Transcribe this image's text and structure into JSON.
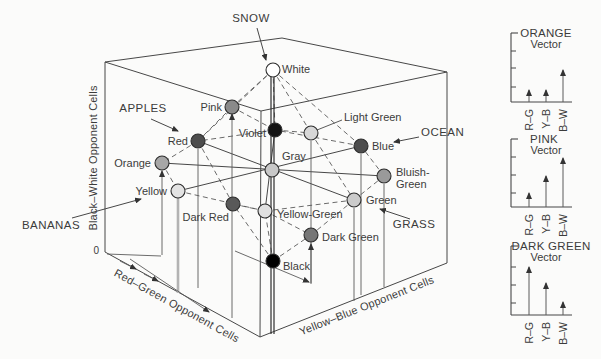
{
  "colors": {
    "ink": "#474747",
    "dash": "#5a5a5a",
    "text": "#3b3b3b",
    "bg": "#fbfbfa",
    "node_stroke": "#2d2d2d",
    "thick_drop": "#b3b3b3",
    "arrow": "#333333"
  },
  "cube": {
    "axis_labels": {
      "vertical": "Black–White Opponent Cells",
      "left": "Red–Green Opponent Cells",
      "right": "Yellow–Blue Opponent Cells",
      "origin": "0"
    },
    "corners": {
      "A": [
        105,
        62
      ],
      "B": [
        282,
        38
      ],
      "C": [
        447,
        72
      ],
      "D": [
        261,
        111
      ],
      "A2": [
        105,
        252
      ],
      "D2": [
        260,
        337
      ],
      "C2": [
        447,
        263
      ]
    },
    "edges": [
      [
        "A",
        "B"
      ],
      [
        "B",
        "C"
      ],
      [
        "A",
        "D"
      ],
      [
        "D",
        "C"
      ],
      [
        "A",
        "A2"
      ],
      [
        "D",
        "D2"
      ],
      [
        "C",
        "C2"
      ],
      [
        "A2",
        "D2"
      ],
      [
        "D2",
        "C2"
      ]
    ],
    "axis_line": {
      "x1": 271,
      "x2": 274,
      "y1": 77,
      "y2": 334
    },
    "nodes": [
      {
        "id": "white",
        "label": "White",
        "x": 273,
        "y": 70,
        "fill": "#ffffff",
        "lx": 282,
        "ly": 73,
        "anchor": "start"
      },
      {
        "id": "pink",
        "label": "Pink",
        "x": 232,
        "y": 107,
        "fill": "#8a8a8a",
        "lx": 222,
        "ly": 111,
        "anchor": "end"
      },
      {
        "id": "violet",
        "label": "Violet",
        "x": 275,
        "y": 130,
        "fill": "#141414",
        "lx": 266,
        "ly": 137,
        "anchor": "end"
      },
      {
        "id": "light_green",
        "label": "Light Green",
        "x": 311,
        "y": 133,
        "fill": "#d7d7d7",
        "lx": 344,
        "ly": 121,
        "anchor": "start"
      },
      {
        "id": "red",
        "label": "Red",
        "x": 198,
        "y": 141,
        "fill": "#4d4d4d",
        "lx": 188,
        "ly": 145,
        "anchor": "end"
      },
      {
        "id": "blue",
        "label": "Blue",
        "x": 361,
        "y": 146,
        "fill": "#4d4d4d",
        "lx": 372,
        "ly": 150,
        "anchor": "start"
      },
      {
        "id": "orange",
        "label": "Orange",
        "x": 162,
        "y": 163,
        "fill": "#a7a7a7",
        "lx": 151,
        "ly": 167,
        "anchor": "end"
      },
      {
        "id": "gray",
        "label": "Gray",
        "x": 272,
        "y": 170,
        "fill": "#c8c8c8",
        "lx": 282,
        "ly": 160,
        "anchor": "start"
      },
      {
        "id": "bluish_green",
        "label": "Bluish-",
        "label2": "Green",
        "x": 384,
        "y": 176,
        "fill": "#9a9a9a",
        "lx": 396,
        "ly": 176,
        "anchor": "start",
        "l2x": 396,
        "l2y": 188
      },
      {
        "id": "yellow",
        "label": "Yellow",
        "x": 178,
        "y": 191,
        "fill": "#e3e3e3",
        "lx": 167,
        "ly": 195,
        "anchor": "end"
      },
      {
        "id": "green",
        "label": "Green",
        "x": 354,
        "y": 200,
        "fill": "#cbcbcb",
        "lx": 366,
        "ly": 204,
        "anchor": "start"
      },
      {
        "id": "dark_red",
        "label": "Dark Red",
        "x": 233,
        "y": 204,
        "fill": "#595959",
        "lx": 229,
        "ly": 221,
        "anchor": "end"
      },
      {
        "id": "yellow_green",
        "label": "Yellow-Green",
        "x": 265,
        "y": 211,
        "fill": "#e0e0e0",
        "lx": 277,
        "ly": 218,
        "anchor": "start"
      },
      {
        "id": "dark_green",
        "label": "Dark Green",
        "x": 311,
        "y": 235,
        "fill": "#767676",
        "lx": 322,
        "ly": 241,
        "anchor": "start"
      },
      {
        "id": "black",
        "label": "Black",
        "x": 273,
        "y": 261,
        "fill": "#000000",
        "lx": 283,
        "ly": 270,
        "anchor": "start"
      }
    ],
    "solid_pairs": [
      [
        "orange",
        "bluish_green"
      ],
      [
        "yellow",
        "blue"
      ],
      [
        "red",
        "green"
      ],
      [
        "violet",
        "yellow_green"
      ]
    ],
    "dashed_pairs": [
      [
        "red",
        "orange"
      ],
      [
        "orange",
        "yellow"
      ],
      [
        "yellow",
        "yellow_green"
      ],
      [
        "yellow_green",
        "green"
      ],
      [
        "green",
        "bluish_green"
      ],
      [
        "bluish_green",
        "blue"
      ],
      [
        "blue",
        "violet"
      ],
      [
        "violet",
        "red"
      ],
      [
        "white",
        "pink"
      ],
      [
        "white",
        "violet"
      ],
      [
        "white",
        "light_green"
      ],
      [
        "white",
        "blue"
      ],
      [
        "white",
        "red"
      ],
      [
        "pink",
        "red"
      ],
      [
        "pink",
        "violet"
      ],
      [
        "violet",
        "light_green"
      ],
      [
        "light_green",
        "green"
      ],
      [
        "red",
        "dark_red"
      ],
      [
        "green",
        "dark_green"
      ],
      [
        "dark_red",
        "yellow_green"
      ],
      [
        "yellow_green",
        "dark_green"
      ],
      [
        "black",
        "dark_red"
      ],
      [
        "black",
        "dark_green"
      ],
      [
        "black",
        "yellow_green"
      ]
    ],
    "drop_lines": [
      {
        "x": 232,
        "y_top": 114,
        "y_bot": 318,
        "arrow": true,
        "thick": false
      },
      {
        "x": 162,
        "y_top": 171,
        "y_bot": 255,
        "arrow": true,
        "thick": false
      },
      {
        "x": 178,
        "y_top": 198,
        "y_bot": 293,
        "arrow": false,
        "thick": true
      },
      {
        "x": 198,
        "y_top": 149,
        "y_bot": 288,
        "arrow": false,
        "thick": false
      },
      {
        "x": 311,
        "y_top": 141,
        "y_bot": 283,
        "arrow": false,
        "thick": false
      },
      {
        "x": 311,
        "y_top": 244,
        "y_bot": 284,
        "arrow": true,
        "thick": false
      },
      {
        "x": 361,
        "y_top": 154,
        "y_bot": 295,
        "arrow": false,
        "thick": false
      },
      {
        "x": 354,
        "y_top": 208,
        "y_bot": 301,
        "arrow": false,
        "thick": false
      },
      {
        "x": 384,
        "y_top": 184,
        "y_bot": 287,
        "arrow": false,
        "thick": false
      }
    ],
    "floor_paths": [
      {
        "pts": [
          [
            107,
            254
          ],
          [
            161,
            256
          ]
        ],
        "arrow": false
      },
      {
        "pts": [
          [
            130,
            259
          ],
          [
            209,
            312
          ]
        ],
        "arrow": true
      },
      {
        "pts": [
          [
            120,
            261
          ],
          [
            136,
            269
          ]
        ],
        "arrow": true
      },
      {
        "pts": [
          [
            144,
            274
          ],
          [
            158,
            281
          ]
        ],
        "arrow": true
      },
      {
        "pts": [
          [
            235,
            251
          ],
          [
            309,
            282
          ]
        ],
        "arrow": true
      }
    ],
    "leader_lines": [
      {
        "pts": [
          [
            342,
            120
          ],
          [
            317,
            130
          ]
        ]
      }
    ],
    "callouts": [
      {
        "id": "snow",
        "label": "SNOW",
        "tx": 251,
        "ty": 22,
        "anchor": "middle",
        "arrow": [
          [
            257,
            28
          ],
          [
            266,
            60
          ]
        ]
      },
      {
        "id": "apples",
        "label": "APPLES",
        "tx": 143,
        "ty": 112,
        "anchor": "middle",
        "arrow": [
          [
            151,
            119
          ],
          [
            178,
            131
          ]
        ]
      },
      {
        "id": "ocean",
        "label": "OCEAN",
        "tx": 421,
        "ty": 136,
        "anchor": "start",
        "arrow": [
          [
            419,
            137
          ],
          [
            394,
            142
          ]
        ]
      },
      {
        "id": "bananas",
        "label": "BANANAS",
        "tx": 22,
        "ty": 229,
        "anchor": "start",
        "arrow": [
          [
            72,
            218
          ],
          [
            141,
            199
          ]
        ]
      },
      {
        "id": "grass",
        "label": "GRASS",
        "tx": 414,
        "ty": 228,
        "anchor": "middle",
        "arrow": [
          [
            410,
            219
          ],
          [
            380,
            209
          ]
        ]
      }
    ]
  },
  "vector_panels": {
    "axis_x": 511,
    "baseline_end_x": 572,
    "bar_offsets": [
      18,
      35,
      52
    ],
    "bar_labels": [
      "R–G",
      "Y–B",
      "B–W"
    ],
    "panels": [
      {
        "title": "ORANGE",
        "subtitle": "Vector",
        "top": 33,
        "base": 102,
        "ticks": [
          51,
          68,
          87
        ],
        "bars": [
          12,
          12,
          32
        ],
        "title_x": 546
      },
      {
        "title": "PINK",
        "subtitle": "Vector",
        "top": 139,
        "base": 207,
        "ticks": [
          157,
          175,
          193
        ],
        "bars": [
          14,
          31,
          49
        ],
        "title_x": 544
      },
      {
        "title": "DARK GREEN",
        "subtitle": "Vector",
        "top": 246,
        "base": 315,
        "ticks": [
          267,
          285,
          303
        ],
        "bars": [
          48,
          32,
          13
        ],
        "title_x": 551
      }
    ]
  }
}
